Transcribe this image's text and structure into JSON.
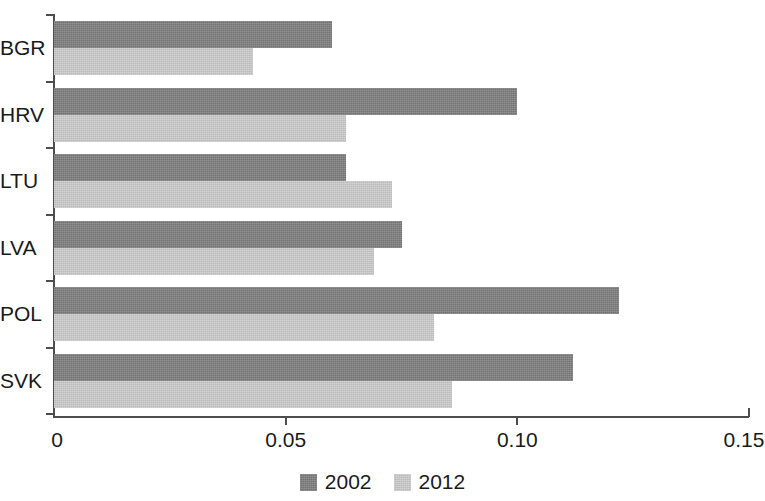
{
  "chart_data": {
    "type": "bar",
    "orientation": "horizontal",
    "title": "",
    "subtitle": "",
    "xlabel": "",
    "ylabel": "",
    "categories": [
      "BGR",
      "HRV",
      "LTU",
      "LVA",
      "POL",
      "SVK"
    ],
    "series": [
      {
        "name": "2002",
        "color": "#7b7b7b",
        "values": [
          0.06,
          0.1,
          0.063,
          0.075,
          0.122,
          0.112
        ]
      },
      {
        "name": "2012",
        "color": "#c9c9c9",
        "values": [
          0.043,
          0.063,
          0.073,
          0.069,
          0.082,
          0.086
        ]
      }
    ],
    "xlim": [
      0,
      0.15
    ],
    "xticks": [
      0,
      0.05,
      0.1,
      0.15
    ],
    "xtick_labels": [
      "0",
      "0.05",
      "0.10",
      "0.15"
    ],
    "grid": false,
    "legend": {
      "position": "bottom-center",
      "entries": [
        "2002",
        "2012"
      ]
    }
  },
  "axis": {
    "x_ticks": [
      {
        "label": "0",
        "value": 0
      },
      {
        "label": "0.05",
        "value": 0.05
      },
      {
        "label": "0.10",
        "value": 0.1
      },
      {
        "label": "0.15",
        "value": 0.15
      }
    ],
    "y_categories": [
      {
        "label": "BGR"
      },
      {
        "label": "HRV"
      },
      {
        "label": "LTU"
      },
      {
        "label": "LVA"
      },
      {
        "label": "POL"
      },
      {
        "label": "SVK"
      }
    ]
  },
  "legend": {
    "items": [
      {
        "label": "2002",
        "color": "#7b7b7b"
      },
      {
        "label": "2012",
        "color": "#c9c9c9"
      }
    ]
  },
  "colors": {
    "series_2002": "#7b7b7b",
    "series_2012": "#c9c9c9",
    "axis": "#4d4d4d",
    "text": "#1a1a1a",
    "background": "#ffffff"
  }
}
